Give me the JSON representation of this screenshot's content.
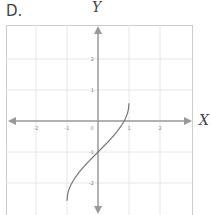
{
  "option_label": "D.",
  "chart_data": {
    "type": "line",
    "title": "",
    "xlabel": "X",
    "ylabel": "Y",
    "xlim": [
      -3,
      3
    ],
    "ylim": [
      -3,
      3
    ],
    "grid": true,
    "x_ticks": [
      -2,
      -1,
      0,
      1,
      2
    ],
    "x_tick_labels": [
      "-2",
      "-1",
      "0",
      "1",
      "2"
    ],
    "y_ticks": [
      2,
      1,
      -1,
      -2
    ],
    "y_tick_labels": [
      "2",
      "1",
      "-1",
      "-2"
    ],
    "series": [
      {
        "name": "y = arcsin(x) - 1",
        "x": [
          -1,
          -0.9,
          -0.75,
          -0.5,
          -0.25,
          0,
          0.25,
          0.5,
          0.75,
          0.9,
          1
        ],
        "values": [
          -2.57,
          -2.12,
          -1.85,
          -1.52,
          -1.25,
          -1,
          -0.75,
          -0.48,
          -0.15,
          0.12,
          0.57
        ]
      }
    ],
    "colors": {
      "axis": "#999999",
      "grid": "#e6e6e6",
      "curve": "#777777",
      "frame": "#cccccc"
    }
  }
}
